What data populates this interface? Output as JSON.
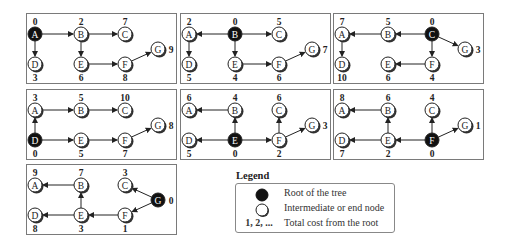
{
  "node_labels": [
    "A",
    "B",
    "C",
    "D",
    "E",
    "F",
    "G"
  ],
  "panels": [
    {
      "root": "A",
      "costs": {
        "A": "0",
        "B": "2",
        "C": "7",
        "D": "3",
        "E": "6",
        "F": "8",
        "G": "9"
      },
      "edges": [
        [
          "A",
          "B"
        ],
        [
          "B",
          "C"
        ],
        [
          "A",
          "D"
        ],
        [
          "B",
          "E"
        ],
        [
          "E",
          "F"
        ],
        [
          "F",
          "G"
        ]
      ]
    },
    {
      "root": "B",
      "costs": {
        "A": "2",
        "B": "0",
        "C": "5",
        "D": "5",
        "E": "4",
        "F": "6",
        "G": "7"
      },
      "edges": [
        [
          "B",
          "A"
        ],
        [
          "B",
          "C"
        ],
        [
          "A",
          "D"
        ],
        [
          "B",
          "E"
        ],
        [
          "E",
          "F"
        ],
        [
          "F",
          "G"
        ]
      ]
    },
    {
      "root": "C",
      "costs": {
        "A": "7",
        "B": "5",
        "C": "0",
        "D": "10",
        "E": "6",
        "F": "4",
        "G": "3"
      },
      "edges": [
        [
          "C",
          "B"
        ],
        [
          "B",
          "A"
        ],
        [
          "A",
          "D"
        ],
        [
          "C",
          "F"
        ],
        [
          "F",
          "E"
        ],
        [
          "C",
          "G"
        ]
      ]
    },
    {
      "root": "D",
      "costs": {
        "A": "3",
        "B": "5",
        "C": "10",
        "D": "0",
        "E": "5",
        "F": "7",
        "G": "8"
      },
      "edges": [
        [
          "D",
          "A"
        ],
        [
          "A",
          "B"
        ],
        [
          "B",
          "C"
        ],
        [
          "D",
          "E"
        ],
        [
          "E",
          "F"
        ],
        [
          "F",
          "G"
        ]
      ]
    },
    {
      "root": "E",
      "costs": {
        "A": "6",
        "B": "4",
        "C": "6",
        "D": "5",
        "E": "0",
        "F": "2",
        "G": "3"
      },
      "edges": [
        [
          "E",
          "B"
        ],
        [
          "B",
          "A"
        ],
        [
          "E",
          "D"
        ],
        [
          "E",
          "F"
        ],
        [
          "F",
          "C"
        ],
        [
          "F",
          "G"
        ]
      ]
    },
    {
      "root": "F",
      "costs": {
        "A": "8",
        "B": "6",
        "C": "4",
        "D": "7",
        "E": "2",
        "F": "0",
        "G": "1"
      },
      "edges": [
        [
          "F",
          "E"
        ],
        [
          "E",
          "B"
        ],
        [
          "B",
          "A"
        ],
        [
          "E",
          "D"
        ],
        [
          "F",
          "C"
        ],
        [
          "F",
          "G"
        ]
      ]
    },
    {
      "root": "G",
      "costs": {
        "A": "9",
        "B": "7",
        "C": "3",
        "D": "8",
        "E": "3",
        "F": "1",
        "G": "0"
      },
      "edges": [
        [
          "G",
          "C"
        ],
        [
          "G",
          "F"
        ],
        [
          "F",
          "E"
        ],
        [
          "E",
          "B"
        ],
        [
          "B",
          "A"
        ],
        [
          "E",
          "D"
        ]
      ]
    }
  ],
  "legend": {
    "title": "Legend",
    "items": [
      {
        "symbol": "root-node",
        "label": "Root of the tree"
      },
      {
        "symbol": "plain-node",
        "label": "Intermediate or end node"
      },
      {
        "symbol": "1, 2, ...",
        "label": "Total cost from the root"
      }
    ]
  },
  "colors": {
    "root_fill": "#111111",
    "node_fill": "#ffffff",
    "stroke": "#222222",
    "border": "#7a7a7a"
  }
}
